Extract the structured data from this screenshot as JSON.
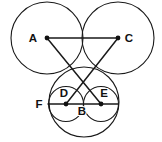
{
  "figure": {
    "canvas": {
      "width": 162,
      "height": 142,
      "background": "#ffffff"
    },
    "stroke_color": "#1a1a1a",
    "label_color": "#111111",
    "points": {
      "A": {
        "label": "A",
        "x": 47,
        "y": 38,
        "label_x": 33,
        "label_y": 42,
        "dot": true
      },
      "C": {
        "label": "C",
        "x": 118,
        "y": 38,
        "label_x": 126,
        "label_y": 42,
        "dot": true
      },
      "B": {
        "label": "B",
        "x": 84,
        "y": 104,
        "label_x": 78,
        "label_y": 115,
        "dot": false
      },
      "D": {
        "label": "D",
        "x": 66,
        "y": 104,
        "label_x": 60,
        "label_y": 97,
        "dot": true
      },
      "E": {
        "label": "E",
        "x": 101,
        "y": 104,
        "label_x": 100,
        "label_y": 97,
        "dot": true
      },
      "F": {
        "label": "F",
        "x": 48,
        "y": 104,
        "label_x": 35,
        "label_y": 108,
        "dot": false
      }
    },
    "circles": [
      {
        "name": "upper-left-circle",
        "cx": 47,
        "cy": 38,
        "r": 36
      },
      {
        "name": "upper-right-circle",
        "cx": 118,
        "cy": 38,
        "r": 36
      },
      {
        "name": "lower-large-circle",
        "cx": 84,
        "cy": 102,
        "r": 35
      },
      {
        "name": "inner-left-circle",
        "cx": 66,
        "cy": 104,
        "r": 17.5
      },
      {
        "name": "inner-right-circle",
        "cx": 101,
        "cy": 104,
        "r": 17.5
      }
    ],
    "segments": [
      {
        "name": "segment-A-C",
        "x1": 47,
        "y1": 38,
        "x2": 118,
        "y2": 38
      },
      {
        "name": "segment-A-E",
        "x1": 47,
        "y1": 38,
        "x2": 101,
        "y2": 104
      },
      {
        "name": "segment-C-D",
        "x1": 118,
        "y1": 38,
        "x2": 66,
        "y2": 104
      },
      {
        "name": "segment-F-E",
        "x1": 48,
        "y1": 104,
        "x2": 118,
        "y2": 104
      }
    ]
  }
}
